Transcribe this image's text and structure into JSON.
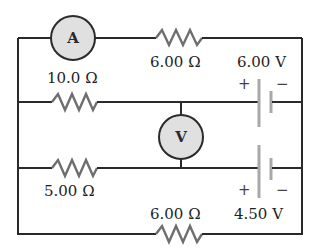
{
  "diagram": {
    "type": "circuit",
    "components": {
      "ammeter": {
        "symbol": "A",
        "position": "top branch, left"
      },
      "voltmeter": {
        "symbol": "V",
        "position": "between middle branches"
      },
      "resistor_top": {
        "label": "6.00 Ω",
        "position": "top branch"
      },
      "resistor_upper_left": {
        "label": "10.0 Ω",
        "position": "second branch, left"
      },
      "resistor_lower_left": {
        "label": "5.00 Ω",
        "position": "third branch, left"
      },
      "resistor_bottom": {
        "label": "6.00 Ω",
        "position": "bottom branch"
      },
      "battery_upper": {
        "label": "6.00 V",
        "plus": "+",
        "minus": "−"
      },
      "battery_lower": {
        "label": "4.50 V",
        "plus": "+",
        "minus": "−"
      }
    }
  }
}
